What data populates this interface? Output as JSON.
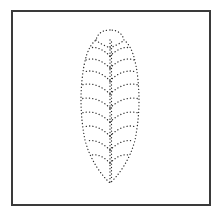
{
  "figure": {
    "colors": {
      "frame": "#3a3a3a",
      "dots": "#2a2a2a",
      "background": "#ffffff"
    },
    "leaf": {
      "top": [
        110,
        30
      ],
      "bottom": [
        110,
        183
      ],
      "left_extent": 81,
      "right_extent": 138,
      "vein_count_per_side": 9,
      "vein_y": [
        46,
        58,
        70,
        83,
        96,
        110,
        124,
        138,
        152
      ]
    }
  }
}
